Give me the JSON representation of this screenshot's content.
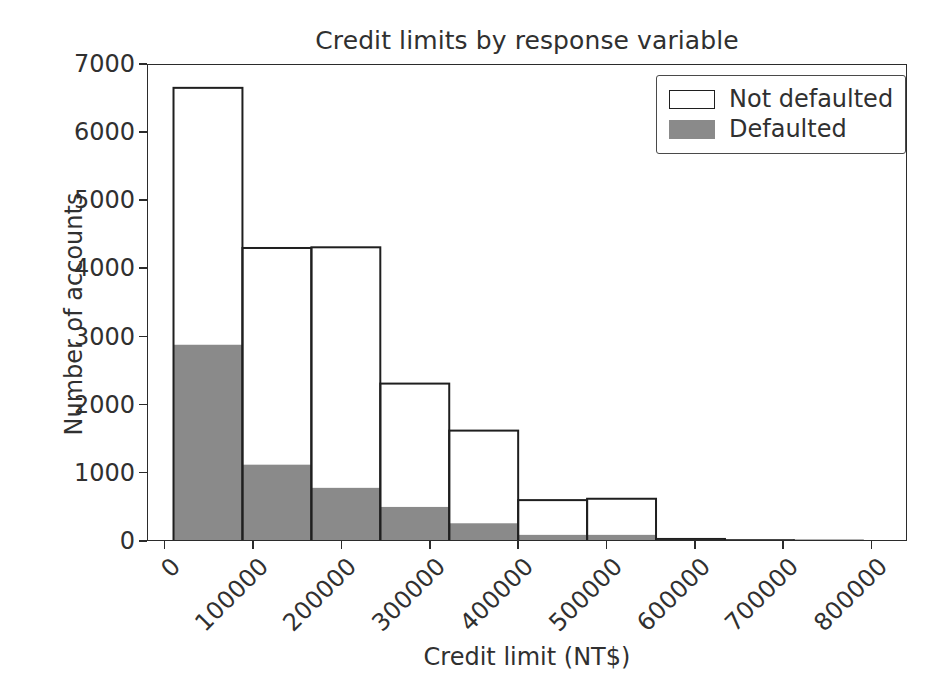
{
  "figure": {
    "width": 947,
    "height": 689,
    "background": "#ffffff"
  },
  "chart_data": {
    "type": "bar",
    "title": "Credit limits by response variable",
    "xlabel": "Credit limit (NT$)",
    "ylabel": "Number of accounts",
    "xlim": [
      -20000,
      840000
    ],
    "ylim": [
      0,
      7000
    ],
    "grid": false,
    "legend_position": "upper right",
    "x_ticks": [
      0,
      100000,
      200000,
      300000,
      400000,
      500000,
      600000,
      700000,
      800000
    ],
    "x_tick_labels": [
      "0",
      "100000",
      "200000",
      "300000",
      "400000",
      "500000",
      "600000",
      "700000",
      "800000"
    ],
    "x_tick_label_rotation": -45,
    "y_ticks": [
      0,
      1000,
      2000,
      3000,
      4000,
      5000,
      6000,
      7000
    ],
    "y_tick_labels": [
      "0",
      "1000",
      "2000",
      "3000",
      "4000",
      "5000",
      "6000",
      "7000"
    ],
    "bin_edges": [
      10000,
      88000,
      166000,
      244000,
      322000,
      400000,
      478000,
      556000,
      634000,
      712000,
      790000
    ],
    "series": [
      {
        "name": "Not defaulted",
        "style": "step-outline",
        "facecolor": "#ffffff",
        "edgecolor": "#1f1f1f",
        "values": [
          6650,
          4300,
          4310,
          2310,
          1620,
          600,
          620,
          30,
          12,
          5
        ]
      },
      {
        "name": "Defaulted",
        "style": "filled",
        "facecolor": "#8a8a8a",
        "edgecolor": "#8a8a8a",
        "values": [
          2880,
          1120,
          780,
          500,
          260,
          90,
          90,
          10,
          3,
          1
        ]
      }
    ]
  },
  "legend": {
    "entries": [
      {
        "label": "Not defaulted",
        "swatch": "outline",
        "color": "#ffffff"
      },
      {
        "label": "Defaulted",
        "swatch": "filled",
        "color": "#8a8a8a"
      }
    ]
  },
  "colors": {
    "axis": "#2b2b2b",
    "text": "#303030",
    "defaulted_fill": "#8a8a8a",
    "not_defaulted_edge": "#1f1f1f",
    "background": "#ffffff"
  }
}
